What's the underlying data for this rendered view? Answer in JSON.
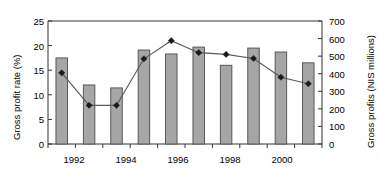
{
  "chart_data": {
    "type": "bar",
    "title": "",
    "xlabel": "",
    "ylabel": "Gross profit rate (%)",
    "y2label": "Gross profits (NIS millions)",
    "grid": false,
    "legend": "none",
    "categories": [
      "1992",
      "1993",
      "1994",
      "1995",
      "1996",
      "1997",
      "1998",
      "1999",
      "2000",
      "2001"
    ],
    "x_tick_labels": [
      "1992",
      "1994",
      "1996",
      "1998",
      "2000"
    ],
    "ylim": [
      0,
      25
    ],
    "y_ticks": [
      0,
      5,
      10,
      15,
      20,
      25
    ],
    "y2lim": [
      0,
      700
    ],
    "y2_ticks": [
      0,
      100,
      200,
      300,
      400,
      500,
      600,
      700
    ],
    "series": [
      {
        "name": "Gross profit rate (%)",
        "type": "bar",
        "axis": "left",
        "values": [
          17.5,
          12.0,
          11.4,
          19.1,
          18.3,
          19.7,
          16.0,
          19.5,
          18.7,
          16.5
        ]
      },
      {
        "name": "Gross profits (NIS millions)",
        "type": "line",
        "axis": "right",
        "values": [
          405,
          220,
          220,
          485,
          588,
          520,
          510,
          487,
          380,
          343
        ]
      }
    ],
    "colors": {
      "bar_fill": "#a6a6a6",
      "bar_stroke": "#4d4d4d",
      "line_stroke": "#595959",
      "marker_fill": "#1a1a1a",
      "axis": "#333333",
      "background": "#ffffff"
    }
  }
}
